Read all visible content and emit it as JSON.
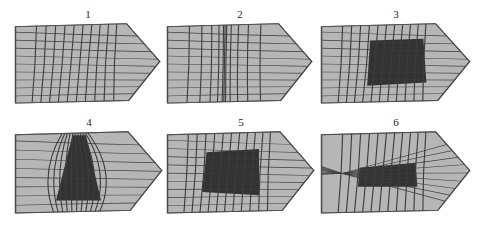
{
  "figure": {
    "background_color": "#ffffff",
    "width": 485,
    "height": 227,
    "rows": 2,
    "columns": 3
  },
  "style": {
    "shape_fill": "#b6b6b6",
    "shape_stroke": "#4a4a4a",
    "line_color": "#3d3d3d",
    "dark_fill": "#333333",
    "label_color": "#262626"
  },
  "panels": [
    {
      "id": "panel-1",
      "label": "1",
      "x": 14,
      "y": 8,
      "w": 148,
      "h": 100,
      "has_dark_region": false,
      "dark_region": null,
      "vertical_focus": null,
      "horizontal_focus": null,
      "v_count": 10,
      "h_count": 9,
      "note": "uniform crossing grid, no caustic region"
    },
    {
      "id": "panel-2",
      "label": "2",
      "x": 166,
      "y": 8,
      "w": 148,
      "h": 100,
      "has_dark_region": false,
      "dark_region": null,
      "vertical_focus": null,
      "horizontal_focus": null,
      "v_count": 11,
      "h_count": 9,
      "note": "vertical lines bunched near centre"
    },
    {
      "id": "panel-3",
      "label": "3",
      "x": 320,
      "y": 8,
      "w": 152,
      "h": 100,
      "has_dark_region": true,
      "dark_region": {
        "x1": 0.33,
        "y1": 0.22,
        "x2": 0.68,
        "y2": 0.2,
        "x3": 0.7,
        "y3": 0.72,
        "x4": 0.31,
        "y4": 0.76
      },
      "vertical_focus": null,
      "horizontal_focus": null,
      "v_count": 11,
      "h_count": 9,
      "note": "solid dark quadrilateral centred in the grid"
    },
    {
      "id": "panel-4",
      "label": "4",
      "x": 14,
      "y": 116,
      "w": 150,
      "h": 102,
      "has_dark_region": true,
      "dark_region": {
        "x1": 0.39,
        "y1": 0.06,
        "x2": 0.48,
        "y2": 0.06,
        "x3": 0.58,
        "y3": 0.82,
        "x4": 0.28,
        "y4": 0.82
      },
      "vertical_focus": "top-and-bottom",
      "horizontal_focus": null,
      "v_count": 11,
      "h_count": 8,
      "note": "vertical lines pinch to narrow necks top and bottom, dark wedge between"
    },
    {
      "id": "panel-5",
      "label": "5",
      "x": 166,
      "y": 116,
      "w": 150,
      "h": 102,
      "has_dark_region": true,
      "dark_region": {
        "x1": 0.27,
        "y1": 0.26,
        "x2": 0.62,
        "y2": 0.22,
        "x3": 0.62,
        "y3": 0.76,
        "x4": 0.24,
        "y4": 0.72
      },
      "vertical_focus": null,
      "horizontal_focus": null,
      "v_count": 11,
      "h_count": 9,
      "note": "dark quadrilateral shifted left of centre"
    },
    {
      "id": "panel-6",
      "label": "6",
      "x": 320,
      "y": 116,
      "w": 152,
      "h": 102,
      "has_dark_region": true,
      "dark_region": {
        "x1": 0.26,
        "y1": 0.44,
        "x2": 0.63,
        "y2": 0.38,
        "x3": 0.64,
        "y3": 0.66,
        "x4": 0.25,
        "y4": 0.66
      },
      "vertical_focus": null,
      "horizontal_focus": "left-middle",
      "v_count": 11,
      "h_count": 9,
      "note": "horizontal lines converge to a point at mid-left, dark slab across middle"
    }
  ]
}
